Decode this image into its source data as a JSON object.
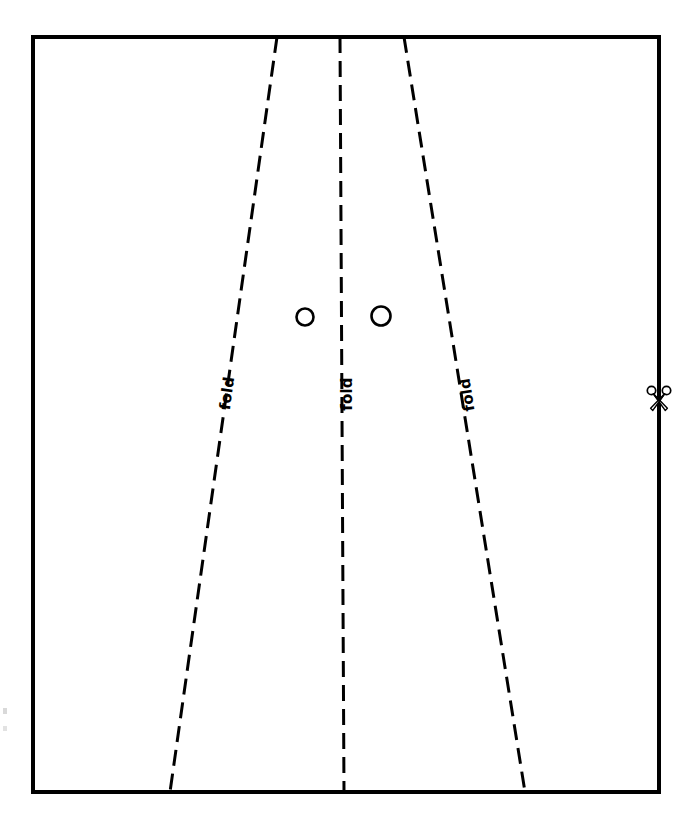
{
  "page": {
    "background_color": "#ffffff",
    "ink_color": "#000000",
    "width": 693,
    "height": 832
  },
  "sheet": {
    "name": "paper-sheet-outline",
    "stroke_color": "#000000",
    "stroke_width": 4,
    "left": 33,
    "top": 37,
    "right": 659,
    "bottom": 792
  },
  "fold_lines": [
    {
      "id": "fold-line-left",
      "label": "fold",
      "style": "dashed",
      "stroke_color": "#000000",
      "stroke_width": 3,
      "dash": "16 8",
      "x_top": 277,
      "y_top": 37,
      "x_bottom": 170,
      "y_bottom": 792,
      "label_x": 232,
      "label_y": 394,
      "label_rotation": -82
    },
    {
      "id": "fold-line-center",
      "label": "fold",
      "style": "dashed",
      "stroke_color": "#000000",
      "stroke_width": 3,
      "dash": "16 8",
      "x_top": 340,
      "y_top": 37,
      "x_bottom": 344,
      "y_bottom": 792,
      "label_x": 352,
      "label_y": 394,
      "label_rotation": -90
    },
    {
      "id": "fold-line-right",
      "label": "fold",
      "style": "dashed",
      "stroke_color": "#000000",
      "stroke_width": 3,
      "dash": "16 8",
      "x_top": 404,
      "y_top": 37,
      "x_bottom": 525,
      "y_bottom": 792,
      "label_x": 472,
      "label_y": 394,
      "label_rotation": -99
    }
  ],
  "punch_holes": [
    {
      "id": "punch-hole-left",
      "cx": 305,
      "cy": 317,
      "r": 8.5,
      "stroke_color": "#000000",
      "stroke_width": 2.6,
      "fill": "none"
    },
    {
      "id": "punch-hole-right",
      "cx": 381,
      "cy": 316,
      "r": 9.5,
      "stroke_color": "#000000",
      "stroke_width": 2.6,
      "fill": "none"
    }
  ],
  "cut_marker": {
    "id": "scissors-cut-marker",
    "icon": "scissors-icon",
    "label": "",
    "x": 659,
    "y": 398,
    "size": 26,
    "stroke_color": "#000000"
  },
  "legend": {
    "fold_label": "fold",
    "cut_hint": ""
  },
  "edge_artifacts": [
    {
      "id": "edge-speck-upper",
      "x": 3,
      "y": 708,
      "w": 4,
      "h": 6,
      "color": "#d9d9d9"
    },
    {
      "id": "edge-speck-lower",
      "x": 3,
      "y": 726,
      "w": 4,
      "h": 5,
      "color": "#e2e2e2"
    }
  ]
}
